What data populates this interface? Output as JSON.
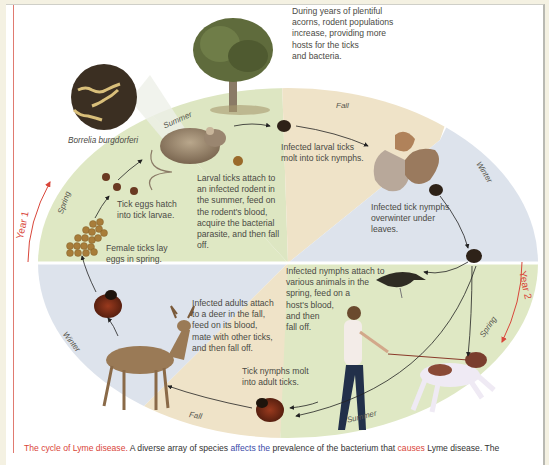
{
  "diagram": {
    "title": "The cycle of Lyme disease",
    "bacterium_label": "Borrelia burgdorferi",
    "top_note": [
      "During years of plentiful",
      "acorns, rodent populations",
      "increase, providing more",
      "hosts for the ticks",
      "and bacteria."
    ],
    "years": {
      "year1": "Year 1",
      "year2": "Year 2"
    },
    "seasons": {
      "y1_spring": "Spring",
      "y1_summer": "Summer",
      "y1_fall": "Fall",
      "y1_winter": "Winter",
      "y2_spring": "Spring",
      "y2_summer": "Summer",
      "y2_fall": "Fall",
      "y2_winter": "Winter"
    },
    "steps": {
      "eggs": [
        "Female ticks lay",
        "eggs in spring."
      ],
      "hatch": [
        "Tick eggs hatch",
        "into tick larvae."
      ],
      "larval_attach": [
        "Larval ticks attach to",
        "an infected rodent in",
        "the summer, feed on",
        "the rodent's blood,",
        "acquire the bacterial",
        "parasite, and then fall",
        "off."
      ],
      "larval_molt": [
        "Infected larval ticks",
        "molt into tick nymphs."
      ],
      "overwinter": [
        "Infected tick nymphs",
        "overwinter under",
        "leaves."
      ],
      "nymph_attach": [
        "Infected nymphs attach to",
        "various animals in the",
        "spring, feed on a",
        "host's blood,",
        "and then",
        "fall off."
      ],
      "nymph_molt": [
        "Tick nymphs molt",
        "into adult ticks."
      ],
      "adult_attach": [
        "Infected adults attach",
        "to a deer in the fall,",
        "feed on its blood,",
        "mate with other ticks,",
        "and then fall off."
      ]
    },
    "colors": {
      "spring_summer_green": "#dfe8c4",
      "fall_tan": "#efe3c8",
      "winter_blue": "#dde3ec",
      "accent_red": "#d9463a",
      "link_blue": "#3a4aa8"
    }
  },
  "caption": {
    "title": "The cycle of Lyme disease.",
    "part1": " A diverse array of species ",
    "link": "affects the",
    "part2": " prevalence of the bacterium that ",
    "red_word": "causes",
    "part3": " Lyme disease. The"
  }
}
